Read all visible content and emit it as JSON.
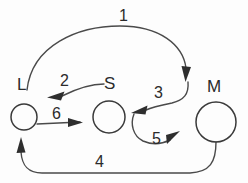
{
  "diagram": {
    "background_color": "#fdfdfd",
    "stroke_color": "#3a3a3a",
    "text_color": "#2b2b2b",
    "nodes": [
      {
        "id": "L",
        "label": "L",
        "cx": 24,
        "cy": 117,
        "r": 13,
        "label_x": 17,
        "label_y": 76
      },
      {
        "id": "S",
        "label": "S",
        "cx": 109,
        "cy": 117,
        "r": 16,
        "label_x": 104,
        "label_y": 75
      },
      {
        "id": "M",
        "label": "M",
        "cx": 216,
        "cy": 122,
        "r": 20,
        "label_x": 207,
        "label_y": 78
      }
    ],
    "edges": [
      {
        "id": "e1",
        "label": "1",
        "from": "L",
        "to": "M",
        "label_x": 119,
        "label_y": 8
      },
      {
        "id": "e2",
        "label": "2",
        "from": "S",
        "to": "L",
        "label_x": 60,
        "label_y": 73
      },
      {
        "id": "e3",
        "label": "3",
        "from": "M",
        "to": "S",
        "label_x": 154,
        "label_y": 85
      },
      {
        "id": "e4",
        "label": "4",
        "from": "M",
        "to": "L",
        "label_x": 95,
        "label_y": 154
      },
      {
        "id": "e5",
        "label": "5",
        "from": "S",
        "to": "M",
        "label_x": 152,
        "label_y": 131
      },
      {
        "id": "e6",
        "label": "6",
        "from": "L",
        "to": "S",
        "label_x": 52,
        "label_y": 106
      }
    ]
  }
}
